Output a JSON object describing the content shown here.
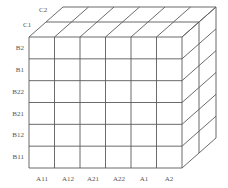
{
  "diagram": {
    "type": "3d-grid-cube",
    "line_color": "#5a5a5a",
    "front_face": {
      "x0": 29,
      "y0": 37,
      "x1": 182,
      "y1": 168
    },
    "depth_offset_per_layer": {
      "dx": 17,
      "dy": -15
    },
    "columns": [
      "A11",
      "A12",
      "A21",
      "A22",
      "A1",
      "A2"
    ],
    "rows": [
      "B2",
      "B1",
      "B22",
      "B21",
      "B12",
      "B11"
    ],
    "layers": [
      "C1",
      "C2"
    ]
  }
}
